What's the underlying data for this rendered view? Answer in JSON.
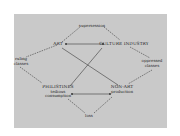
{
  "diagram": {
    "background": "#c9c9c9",
    "line_color": "#3a3a3a",
    "nodes": {
      "top": "supersession",
      "art": "ART",
      "culture_industry": "CULTURE INDUSTRY",
      "left_1": "ruling",
      "left_2": "classes",
      "right_1": "oppressed",
      "right_2": "classes",
      "philistines": "PHILISTINES",
      "philistines_sub1": "tedious",
      "philistines_sub2": "consumption",
      "non_art": "NON-ART",
      "non_art_sub": "production",
      "bottom": "loss"
    },
    "edges": [
      {
        "from": "art",
        "to": "culture_industry",
        "style": "solid",
        "arrows": "both"
      },
      {
        "from": "philistines",
        "to": "non_art",
        "style": "solid",
        "arrows": "both"
      },
      {
        "from": "art",
        "to": "non_art",
        "style": "solid"
      },
      {
        "from": "culture_industry",
        "to": "philistines",
        "style": "solid"
      },
      {
        "from": "art",
        "to": "top",
        "style": "dashed"
      },
      {
        "from": "top",
        "to": "culture_industry",
        "style": "dashed"
      },
      {
        "from": "art",
        "to": "left",
        "style": "dashed"
      },
      {
        "from": "left",
        "to": "philistines",
        "style": "dashed"
      },
      {
        "from": "culture_industry",
        "to": "right",
        "style": "dashed"
      },
      {
        "from": "right",
        "to": "non_art",
        "style": "dashed"
      },
      {
        "from": "philistines",
        "to": "bottom",
        "style": "dashed"
      },
      {
        "from": "bottom",
        "to": "non_art",
        "style": "dashed"
      }
    ]
  }
}
